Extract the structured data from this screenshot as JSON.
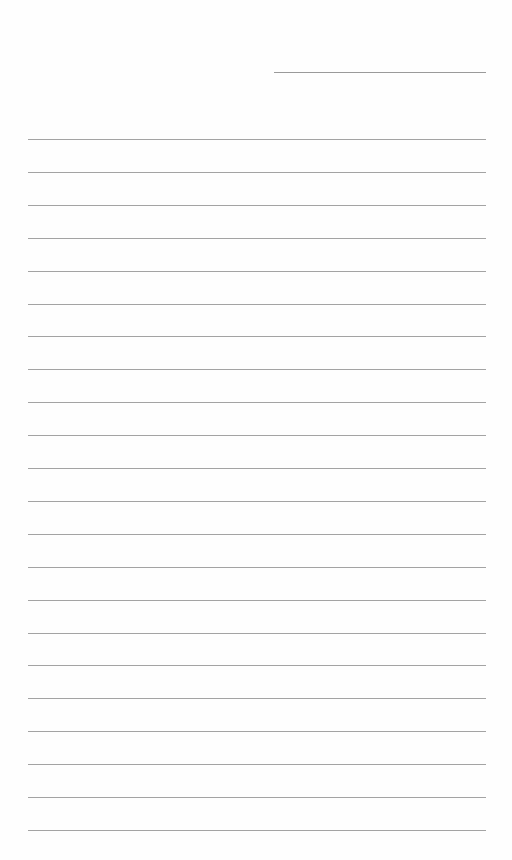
{
  "document": {
    "type": "lined-paper",
    "header_line": {
      "x": 274,
      "y": 72,
      "width": 212
    },
    "rules": {
      "count": 22,
      "start_y": 139,
      "spacing": 32.9,
      "x": 28,
      "width": 458
    },
    "colors": {
      "paper": "#fefefe",
      "line": "#a3a3a3"
    }
  }
}
